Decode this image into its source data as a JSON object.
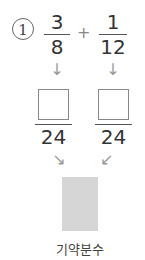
{
  "problem": {
    "number": "1",
    "left_fraction": {
      "numerator": "3",
      "denominator": "8"
    },
    "operator": "+",
    "right_fraction": {
      "numerator": "1",
      "denominator": "12"
    },
    "common_denominator_left": "24",
    "common_denominator_right": "24",
    "left_numerator_answer": "",
    "right_numerator_answer": "",
    "result_label": "기약분수"
  },
  "icons": {
    "down_arrow": "↓",
    "diag_right": "↘",
    "diag_left": "↙"
  }
}
